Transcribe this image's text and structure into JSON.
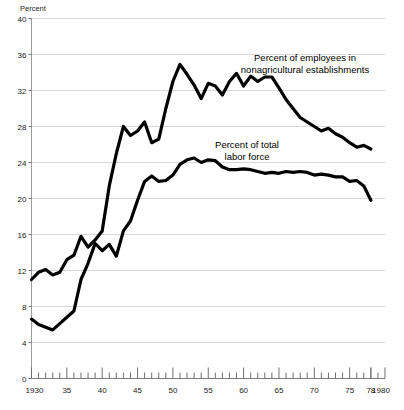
{
  "chart_data": {
    "type": "line",
    "title": "",
    "subtitle": "",
    "xlabel": "",
    "ylabel": "Percent",
    "ylim": [
      0,
      40
    ],
    "xlim": [
      1930,
      1980
    ],
    "grid": true,
    "legend_position": "inline-annotation",
    "y_ticks": [
      0,
      4,
      8,
      12,
      16,
      20,
      24,
      28,
      32,
      36,
      40
    ],
    "y_tick_labels": [
      "0",
      "4",
      "8",
      "12",
      "16",
      "20",
      "24",
      "28",
      "32",
      "36",
      "40"
    ],
    "x_ticks": [
      1930,
      1935,
      1940,
      1945,
      1950,
      1955,
      1960,
      1965,
      1970,
      1975,
      1978,
      1980
    ],
    "x_tick_labels": [
      "1930",
      "35",
      "40",
      "45",
      "50",
      "55",
      "60",
      "65",
      "70",
      "75",
      "78",
      "1980"
    ],
    "x_minor_tick_interval": 1,
    "line_color": "#000000",
    "line_width": 3.2,
    "grid_color": "#d8d8d8",
    "axis_color": "#8a8a8a",
    "background_color": "#ffffff",
    "series": [
      {
        "name": "Percent of employees in nonagricultural establishments",
        "annotation_label": "Percent of employees in\nnonagricultural establishments",
        "annotation_line1": "Percent of employees in",
        "annotation_line2": "nonagricultural establishments",
        "x": [
          1930,
          1931,
          1932,
          1933,
          1934,
          1935,
          1936,
          1937,
          1938,
          1939,
          1940,
          1941,
          1942,
          1943,
          1944,
          1945,
          1946,
          1947,
          1948,
          1949,
          1950,
          1951,
          1952,
          1953,
          1954,
          1955,
          1956,
          1957,
          1958,
          1959,
          1960,
          1961,
          1962,
          1963,
          1964,
          1965,
          1966,
          1967,
          1968,
          1969,
          1970,
          1971,
          1972,
          1973,
          1974,
          1975,
          1976,
          1977,
          1978
        ],
        "values": [
          11.0,
          11.8,
          12.1,
          11.5,
          11.8,
          13.2,
          13.7,
          15.8,
          14.6,
          15.4,
          16.4,
          21.4,
          25.0,
          28.0,
          27.0,
          27.5,
          28.5,
          26.2,
          26.6,
          30.0,
          33.0,
          34.9,
          33.8,
          32.6,
          31.1,
          32.8,
          32.5,
          31.5,
          33.0,
          33.9,
          32.5,
          33.6,
          33.0,
          33.5,
          33.5,
          32.3,
          31.0,
          30.0,
          29.0,
          28.5,
          28.0,
          27.5,
          27.8,
          27.2,
          26.8,
          26.2,
          25.7,
          25.9,
          25.5
        ]
      },
      {
        "name": "Percent of total labor force",
        "annotation_label": "Percent of total\nlabor force",
        "annotation_line1": "Percent of total",
        "annotation_line2": "labor force",
        "x": [
          1930,
          1931,
          1932,
          1933,
          1934,
          1935,
          1936,
          1937,
          1938,
          1939,
          1940,
          1941,
          1942,
          1943,
          1944,
          1945,
          1946,
          1947,
          1948,
          1949,
          1950,
          1951,
          1952,
          1953,
          1954,
          1955,
          1956,
          1957,
          1958,
          1959,
          1960,
          1961,
          1962,
          1963,
          1964,
          1965,
          1966,
          1967,
          1968,
          1969,
          1970,
          1971,
          1972,
          1973,
          1974,
          1975,
          1976,
          1977,
          1978
        ],
        "values": [
          6.6,
          6.0,
          5.7,
          5.4,
          6.1,
          6.8,
          7.5,
          11.0,
          12.8,
          15.0,
          14.2,
          14.9,
          13.6,
          16.4,
          17.5,
          19.8,
          21.9,
          22.5,
          21.9,
          22.0,
          22.6,
          23.8,
          24.3,
          24.5,
          24.0,
          24.3,
          24.2,
          23.5,
          23.2,
          23.2,
          23.3,
          23.2,
          23.0,
          22.8,
          22.9,
          22.8,
          23.0,
          22.9,
          23.0,
          22.9,
          22.6,
          22.7,
          22.6,
          22.4,
          22.4,
          21.9,
          22.0,
          21.4,
          19.8
        ]
      }
    ],
    "annotations": [
      {
        "id": "annotation-nonagricultural",
        "line1": "Percent of employees in",
        "line2": "nonagricultural establishments",
        "x_pos": 305,
        "y_pos": 61
      },
      {
        "id": "annotation-total-labor-force",
        "line1": "Percent of total",
        "line2": "labor force",
        "x_pos": 247,
        "y_pos": 148
      }
    ]
  },
  "axis": {
    "y_title": "Percent"
  }
}
